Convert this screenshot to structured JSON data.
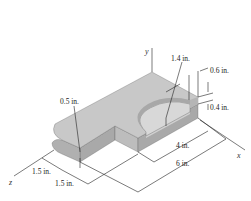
{
  "diagram": {
    "type": "isometric machine part with dimensions",
    "axes": {
      "x": "x",
      "y": "y",
      "z": "z"
    },
    "dimensions": {
      "hole_radius": "1.4 in.",
      "step_width": "0.6 in.",
      "step_depth": "0.4 in.",
      "corner_radius": "0.5 in.",
      "z_dim_1": "1.5 in.",
      "z_dim_2": "1.5 in.",
      "x_dim_short": "4 in.",
      "x_dim_long": "6 in."
    },
    "colors": {
      "top_face": "#c8c8c8",
      "front_face": "#a9a9a9",
      "side_face": "#b8b8b8",
      "hole_floor": "#d6d6d6",
      "line": "#222222"
    }
  }
}
